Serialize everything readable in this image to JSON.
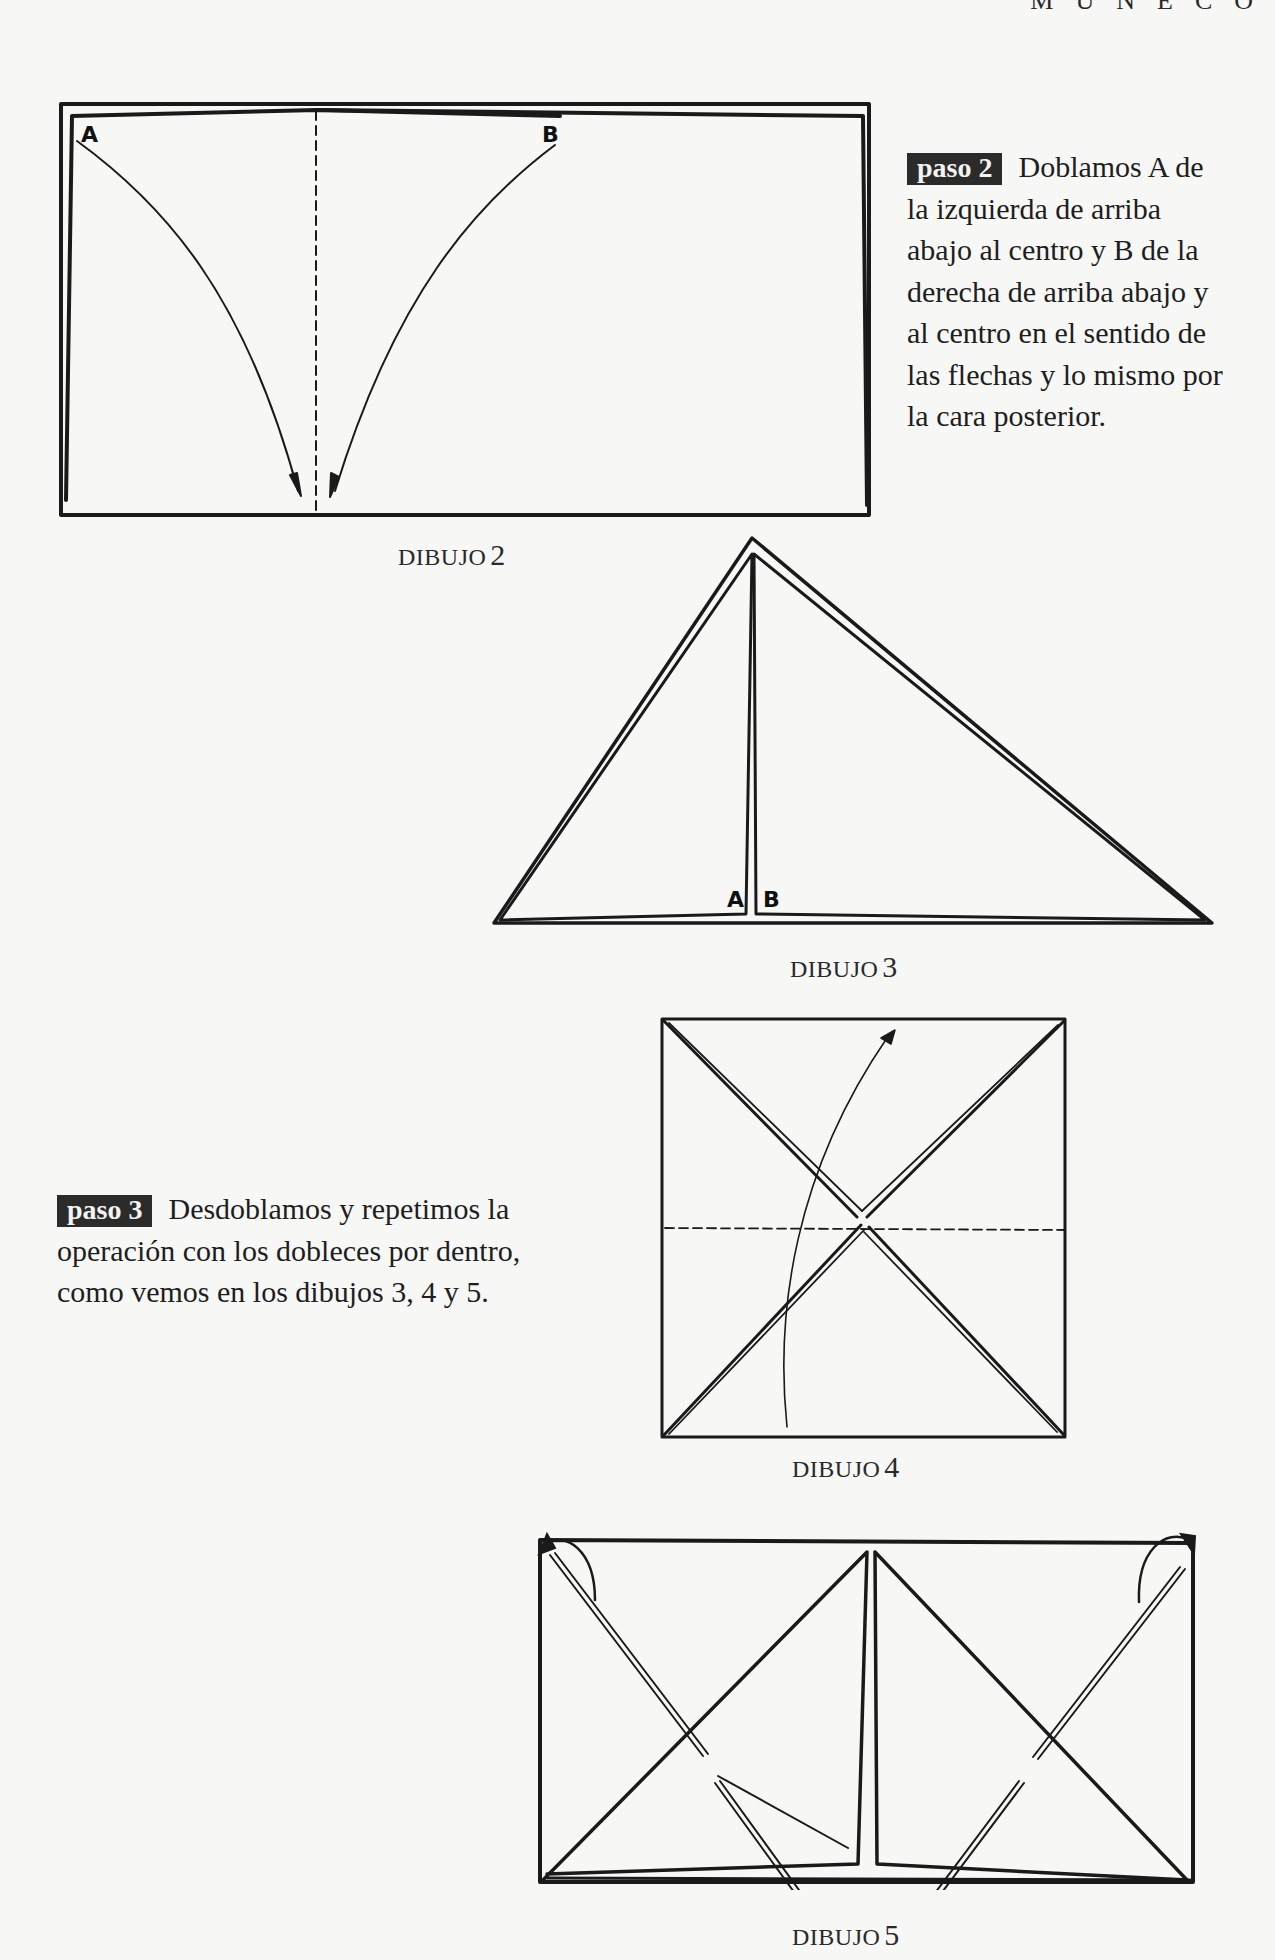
{
  "page": {
    "running_head": "MUÑECO",
    "background_color": "#f7f7f6",
    "ink_color": "#1e1e1e",
    "badge_color": "#2b2b2b"
  },
  "steps": [
    {
      "badge": "paso 2",
      "text": "Doblamos A de la izquierda de arriba abajo al centro y B de la derecha de arriba abajo y al centro en el sentido de las flechas y lo mismo por la cara posterior.",
      "lines": [
        "Doblamos A de",
        "la izquierda de arriba",
        "abajo al centro y B de la",
        "derecha de arriba abajo y",
        "al centro en el sentido de",
        "las flechas y lo mismo por",
        "la cara posterior."
      ]
    },
    {
      "badge": "paso 3",
      "text": "Desdoblamos y repetimos la operación con los dobleces por dentro, como vemos en los dibujos 3, 4 y 5.",
      "lines": [
        "Desdoblamos y repetimos la",
        "operación con los dobleces por dentro,",
        "como vemos en los dibujos 3, 4 y 5."
      ]
    }
  ],
  "diagrams": [
    {
      "caption_word": "DIBUJO",
      "caption_num": "2",
      "shape": "rectangle with center dashed fold line",
      "labels": [
        "A",
        "B"
      ],
      "arrows": [
        "A curved arrow top-left to bottom-center",
        "B curved arrow top-right to bottom-center"
      ]
    },
    {
      "caption_word": "DIBUJO",
      "caption_num": "3",
      "shape": "triangle with center vertical split",
      "labels": [
        "A",
        "B"
      ]
    },
    {
      "caption_word": "DIBUJO",
      "caption_num": "4",
      "shape": "square with diagonal double lines and horizontal dashed fold",
      "arrows": [
        "curved upward arrow"
      ]
    },
    {
      "caption_word": "DIBUJO",
      "caption_num": "5",
      "shape": "rectangle with two triangles and double diagonal creases",
      "arrows": [
        "top-left curl arrow",
        "top-right curl arrow"
      ]
    }
  ]
}
